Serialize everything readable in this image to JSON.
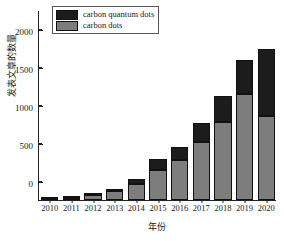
{
  "chart_data": {
    "type": "bar",
    "subtype": "stacked",
    "title": "",
    "xlabel": "年份",
    "ylabel": "发表文章的数量",
    "categories": [
      "2010",
      "2011",
      "2012",
      "2013",
      "2014",
      "2015",
      "2016",
      "2017",
      "2018",
      "2019",
      "2020"
    ],
    "series": [
      {
        "name": "carbon dots",
        "color": "#7d7d7d",
        "values": [
          8,
          25,
          60,
          120,
          210,
          390,
          525,
          760,
          1030,
          1400,
          1110
        ]
      },
      {
        "name": "carbon quantum dots",
        "color": "#1c1c1c",
        "values": [
          4,
          8,
          15,
          20,
          70,
          145,
          170,
          255,
          345,
          440,
          880
        ]
      }
    ],
    "totals": [
      12,
      33,
      75,
      140,
      280,
      535,
      695,
      1015,
      1375,
      1840,
      1990
    ],
    "ylim": [
      0,
      2500
    ],
    "yticks": [
      0,
      500,
      1000,
      1500,
      2000,
      2500
    ],
    "ytick_labels": [
      "0",
      "500",
      "1000",
      "1500",
      "2000",
      "2500"
    ],
    "yminor_ticks": [
      250,
      750,
      1250,
      1750,
      2250
    ],
    "grid": false,
    "legend_position": "upper left",
    "legend_entries": [
      {
        "label": "carbon quantum dots",
        "color": "#1c1c1c"
      },
      {
        "label": "carbon dots",
        "color": "#7d7d7d"
      }
    ]
  }
}
